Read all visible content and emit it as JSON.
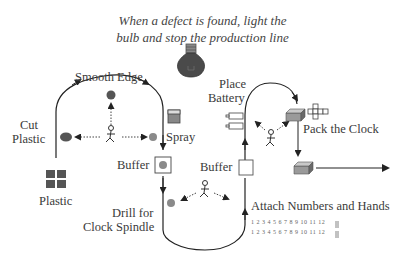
{
  "title": {
    "line1": "When a defect is found, light the",
    "line2": "bulb and stop the production line"
  },
  "labels": {
    "smooth_edge": "Smooth Edge",
    "cut": "Cut",
    "plastic_cut": "Plastic",
    "spray": "Spray",
    "buffer_left": "Buffer",
    "buffer_right": "Buffer",
    "plastic": "Plastic",
    "drill1": "Drill for",
    "drill2": "Clock Spindle",
    "place": "Place",
    "battery": "Battery",
    "pack": "Pack the Clock",
    "attach": "Attach Numbers and Hands",
    "numbers1": "1 2 3 4 5 6 7 8 9 10 11 12",
    "numbers2": "1 2 3 4 5 6 7 8 9 10 11 12"
  },
  "colors": {
    "bulb": "#4a4a4a",
    "dark_dot": "#555555",
    "gray_dot": "#8a8a8a",
    "line": "#222222",
    "box_top": "#c9c9c9",
    "box_front": "#9a9a9a"
  }
}
